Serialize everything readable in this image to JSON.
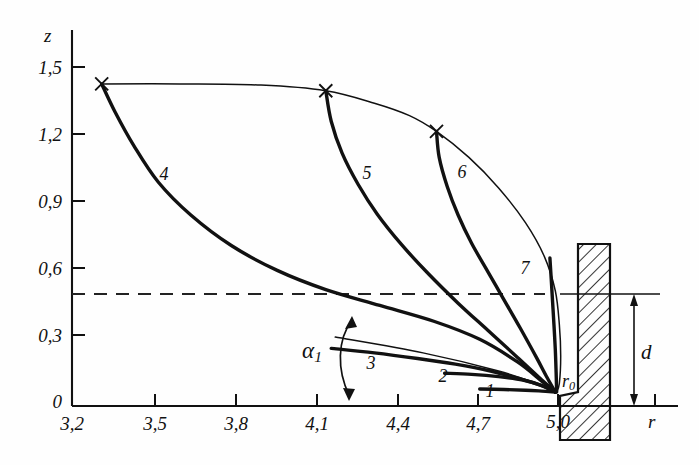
{
  "figure": {
    "axes": {
      "x_axis_name": "r",
      "y_axis_name": "z",
      "x_ticks": [
        "3,2",
        "3,5",
        "3,8",
        "4,1",
        "4,4",
        "4,7",
        "5,0"
      ],
      "y_ticks": [
        "0",
        "0,3",
        "0,6",
        "0,9",
        "1,2",
        "1,5"
      ],
      "origin_label": "0"
    },
    "annotations": {
      "angle_label": "α",
      "angle_sub": "1",
      "nozzle_label": "r",
      "nozzle_sub": "0",
      "gap_label": "d"
    },
    "curve_labels": [
      "1",
      "2",
      "3",
      "4",
      "5",
      "6",
      "7"
    ],
    "colors": {
      "ink": "#111111",
      "background": "#fefefe",
      "hatch": "#111111",
      "dashed": "#222222"
    }
  },
  "chart_data": {
    "type": "line",
    "title": "",
    "subtitle": "",
    "xlabel": "r",
    "ylabel": "z",
    "xlim": [
      3.2,
      5.3
    ],
    "ylim": [
      0,
      1.62
    ],
    "grid": false,
    "legend": "inline-curve-numbers",
    "x_tick_values": [
      3.2,
      3.5,
      3.8,
      4.1,
      4.4,
      4.7,
      5.0
    ],
    "y_tick_values": [
      0,
      0.3,
      0.6,
      0.9,
      1.2,
      1.5
    ],
    "annotations": [
      {
        "name": "dashed-reference-line",
        "type": "hline",
        "y": 0.5,
        "x_from": 3.2,
        "x_to": 5.3,
        "style": "dashed"
      },
      {
        "name": "nozzle-origin",
        "type": "point",
        "x": 5.0,
        "y": 0.06,
        "label": "r0"
      },
      {
        "name": "gap-dimension",
        "type": "vertical-dimension",
        "x": 5.15,
        "y_from": 0.06,
        "y_to": 0.5,
        "label": "d"
      },
      {
        "name": "alpha-angle",
        "type": "angle-arc",
        "label": "α1",
        "vertex_x": 4.17,
        "vertex_y": 0.0
      },
      {
        "name": "wall",
        "type": "hatched-rectangle",
        "x_from": 5.07,
        "x_to": 5.19,
        "y_from": 0.0,
        "y_to": 0.72
      }
    ],
    "series": [
      {
        "name": "1",
        "label_x": 4.68,
        "label_y": 0.055,
        "emphasis": "thick",
        "points": [
          [
            4.71,
            0.075
          ],
          [
            4.8,
            0.073
          ],
          [
            4.88,
            0.07
          ],
          [
            4.94,
            0.066
          ],
          [
            4.99,
            0.062
          ]
        ]
      },
      {
        "name": "2",
        "label_x": 4.58,
        "label_y": 0.13,
        "emphasis": "thick",
        "points": [
          [
            4.58,
            0.145
          ],
          [
            4.68,
            0.14
          ],
          [
            4.78,
            0.13
          ],
          [
            4.87,
            0.115
          ],
          [
            4.94,
            0.09
          ],
          [
            4.99,
            0.062
          ]
        ]
      },
      {
        "name": "3",
        "label_x": 4.25,
        "label_y": 0.195,
        "emphasis": "thick",
        "points": [
          [
            4.16,
            0.255
          ],
          [
            4.32,
            0.235
          ],
          [
            4.48,
            0.21
          ],
          [
            4.62,
            0.185
          ],
          [
            4.75,
            0.155
          ],
          [
            4.86,
            0.12
          ],
          [
            4.94,
            0.09
          ],
          [
            4.99,
            0.062
          ]
        ]
      },
      {
        "name": "4",
        "label_x": 3.53,
        "label_y": 0.855,
        "emphasis": "thick",
        "marker_top": [
          3.31,
          1.425
        ],
        "points": [
          [
            3.31,
            1.425
          ],
          [
            3.36,
            1.3
          ],
          [
            3.43,
            1.15
          ],
          [
            3.52,
            0.99
          ],
          [
            3.64,
            0.845
          ],
          [
            3.79,
            0.71
          ],
          [
            3.96,
            0.6
          ],
          [
            4.14,
            0.515
          ],
          [
            4.34,
            0.445
          ],
          [
            4.54,
            0.375
          ],
          [
            4.71,
            0.295
          ],
          [
            4.85,
            0.195
          ],
          [
            4.94,
            0.11
          ],
          [
            4.99,
            0.062
          ]
        ]
      },
      {
        "name": "5",
        "label_x": 4.25,
        "label_y": 0.845,
        "emphasis": "thick",
        "marker_top": [
          4.14,
          1.395
        ],
        "points": [
          [
            4.14,
            1.395
          ],
          [
            4.16,
            1.26
          ],
          [
            4.2,
            1.12
          ],
          [
            4.26,
            0.98
          ],
          [
            4.33,
            0.85
          ],
          [
            4.42,
            0.715
          ],
          [
            4.52,
            0.585
          ],
          [
            4.63,
            0.455
          ],
          [
            4.74,
            0.335
          ],
          [
            4.85,
            0.215
          ],
          [
            4.94,
            0.115
          ],
          [
            4.99,
            0.062
          ]
        ]
      },
      {
        "name": "6",
        "label_x": 4.6,
        "label_y": 0.855,
        "emphasis": "thick",
        "marker_top": [
          4.55,
          1.215
        ],
        "points": [
          [
            4.55,
            1.215
          ],
          [
            4.56,
            1.1
          ],
          [
            4.59,
            0.97
          ],
          [
            4.63,
            0.845
          ],
          [
            4.68,
            0.72
          ],
          [
            4.74,
            0.595
          ],
          [
            4.8,
            0.47
          ],
          [
            4.86,
            0.345
          ],
          [
            4.92,
            0.215
          ],
          [
            4.96,
            0.125
          ],
          [
            4.99,
            0.062
          ]
        ]
      },
      {
        "name": "7",
        "label_x": 4.83,
        "label_y": 0.495,
        "emphasis": "thick",
        "points": [
          [
            4.97,
            0.655
          ],
          [
            4.975,
            0.56
          ],
          [
            4.98,
            0.46
          ],
          [
            4.985,
            0.36
          ],
          [
            4.99,
            0.25
          ],
          [
            4.993,
            0.15
          ],
          [
            4.995,
            0.062
          ]
        ]
      },
      {
        "name": "envelope",
        "emphasis": "thin",
        "points": [
          [
            3.31,
            1.425
          ],
          [
            3.6,
            1.425
          ],
          [
            3.9,
            1.42
          ],
          [
            4.14,
            1.395
          ],
          [
            4.32,
            1.34
          ],
          [
            4.45,
            1.285
          ],
          [
            4.55,
            1.215
          ],
          [
            4.67,
            1.1
          ],
          [
            4.78,
            0.965
          ],
          [
            4.88,
            0.81
          ],
          [
            4.95,
            0.66
          ],
          [
            4.99,
            0.51
          ],
          [
            5.005,
            0.36
          ],
          [
            5.01,
            0.22
          ],
          [
            5.005,
            0.1
          ],
          [
            4.995,
            0.062
          ]
        ]
      },
      {
        "name": "tangent-ray",
        "emphasis": "thin",
        "points": [
          [
            4.175,
            0.305
          ],
          [
            4.5,
            0.235
          ],
          [
            4.78,
            0.155
          ],
          [
            4.93,
            0.095
          ],
          [
            4.99,
            0.062
          ]
        ]
      }
    ]
  }
}
